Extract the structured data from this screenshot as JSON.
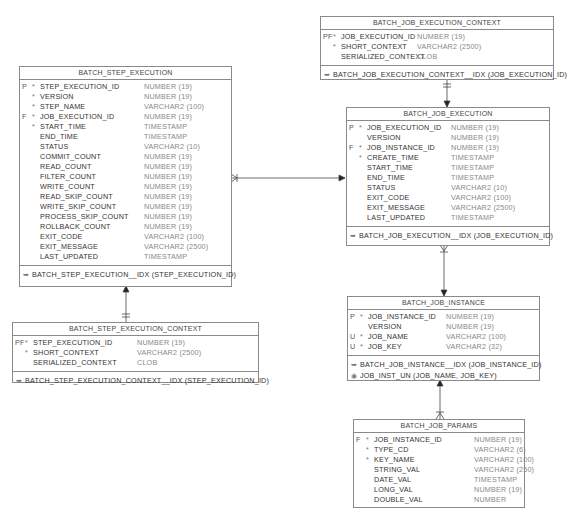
{
  "diagram": {
    "entities": [
      {
        "id": "batch_step_execution",
        "title": "BATCH_STEP_EXECUTION",
        "columns": [
          {
            "key": "P",
            "req": "*",
            "name": "STEP_EXECUTION_ID",
            "type": "NUMBER (19)"
          },
          {
            "key": "",
            "req": "*",
            "name": "VERSION",
            "type": "NUMBER (19)"
          },
          {
            "key": "",
            "req": "*",
            "name": "STEP_NAME",
            "type": "VARCHAR2 (100)"
          },
          {
            "key": "F",
            "req": "*",
            "name": "JOB_EXECUTION_ID",
            "type": "NUMBER (19)"
          },
          {
            "key": "",
            "req": "*",
            "name": "START_TIME",
            "type": "TIMESTAMP"
          },
          {
            "key": "",
            "req": "",
            "name": "END_TIME",
            "type": "TIMESTAMP"
          },
          {
            "key": "",
            "req": "",
            "name": "STATUS",
            "type": "VARCHAR2 (10)"
          },
          {
            "key": "",
            "req": "",
            "name": "COMMIT_COUNT",
            "type": "NUMBER (19)"
          },
          {
            "key": "",
            "req": "",
            "name": "READ_COUNT",
            "type": "NUMBER (19)"
          },
          {
            "key": "",
            "req": "",
            "name": "FILTER_COUNT",
            "type": "NUMBER (19)"
          },
          {
            "key": "",
            "req": "",
            "name": "WRITE_COUNT",
            "type": "NUMBER (19)"
          },
          {
            "key": "",
            "req": "",
            "name": "READ_SKIP_COUNT",
            "type": "NUMBER (19)"
          },
          {
            "key": "",
            "req": "",
            "name": "WRITE_SKIP_COUNT",
            "type": "NUMBER (19)"
          },
          {
            "key": "",
            "req": "",
            "name": "PROCESS_SKIP_COUNT",
            "type": "NUMBER (19)"
          },
          {
            "key": "",
            "req": "",
            "name": "ROLLBACK_COUNT",
            "type": "NUMBER (19)"
          },
          {
            "key": "",
            "req": "",
            "name": "EXIT_CODE",
            "type": "VARCHAR2 (100)"
          },
          {
            "key": "",
            "req": "",
            "name": "EXIT_MESSAGE",
            "type": "VARCHAR2 (2500)"
          },
          {
            "key": "",
            "req": "",
            "name": "LAST_UPDATED",
            "type": "TIMESTAMP"
          }
        ],
        "indexes": [
          {
            "icon": "index-icon",
            "text": "BATCH_STEP_EXECUTION__IDX (STEP_EXECUTION_ID)"
          }
        ]
      },
      {
        "id": "batch_step_execution_context",
        "title": "BATCH_STEP_EXECUTION_CONTEXT",
        "columns": [
          {
            "key": "PF",
            "req": "*",
            "name": "STEP_EXECUTION_ID",
            "type": "NUMBER (19)"
          },
          {
            "key": "",
            "req": "*",
            "name": "SHORT_CONTEXT",
            "type": "VARCHAR2 (2500)"
          },
          {
            "key": "",
            "req": "",
            "name": "SERIALIZED_CONTEXT",
            "type": "CLOB"
          }
        ],
        "indexes": [
          {
            "icon": "index-icon",
            "text": "BATCH_STEP_EXECUTION_CONTEXT__IDX (STEP_EXECUTION_ID)"
          }
        ]
      },
      {
        "id": "batch_job_execution_context",
        "title": "BATCH_JOB_EXECUTION_CONTEXT",
        "columns": [
          {
            "key": "PF",
            "req": "*",
            "name": "JOB_EXECUTION_ID",
            "type": "NUMBER (19)"
          },
          {
            "key": "",
            "req": "*",
            "name": "SHORT_CONTEXT",
            "type": "VARCHAR2 (2500)"
          },
          {
            "key": "",
            "req": "",
            "name": "SERIALIZED_CONTEXT",
            "type": "CLOB"
          }
        ],
        "indexes": [
          {
            "icon": "index-icon",
            "text": "BATCH_JOB_EXECUTION_CONTEXT__IDX (JOB_EXECUTION_ID)"
          }
        ]
      },
      {
        "id": "batch_job_execution",
        "title": "BATCH_JOB_EXECUTION",
        "columns": [
          {
            "key": "P",
            "req": "*",
            "name": "JOB_EXECUTION_ID",
            "type": "NUMBER (19)"
          },
          {
            "key": "",
            "req": "",
            "name": "VERSION",
            "type": "NUMBER (19)"
          },
          {
            "key": "F",
            "req": "*",
            "name": "JOB_INSTANCE_ID",
            "type": "NUMBER (19)"
          },
          {
            "key": "",
            "req": "*",
            "name": "CREATE_TIME",
            "type": "TIMESTAMP"
          },
          {
            "key": "",
            "req": "",
            "name": "START_TIME",
            "type": "TIMESTAMP"
          },
          {
            "key": "",
            "req": "",
            "name": "END_TIME",
            "type": "TIMESTAMP"
          },
          {
            "key": "",
            "req": "",
            "name": "STATUS",
            "type": "VARCHAR2 (10)"
          },
          {
            "key": "",
            "req": "",
            "name": "EXIT_CODE",
            "type": "VARCHAR2 (100)"
          },
          {
            "key": "",
            "req": "",
            "name": "EXIT_MESSAGE",
            "type": "VARCHAR2 (2500)"
          },
          {
            "key": "",
            "req": "",
            "name": "LAST_UPDATED",
            "type": "TIMESTAMP"
          }
        ],
        "indexes": [
          {
            "icon": "index-icon",
            "text": "BATCH_JOB_EXECUTION__IDX (JOB_EXECUTION_ID)"
          }
        ]
      },
      {
        "id": "batch_job_instance",
        "title": "BATCH_JOB_INSTANCE",
        "columns": [
          {
            "key": "P",
            "req": "*",
            "name": "JOB_INSTANCE_ID",
            "type": "NUMBER (19)"
          },
          {
            "key": "",
            "req": "",
            "name": "VERSION",
            "type": "NUMBER (19)"
          },
          {
            "key": "U",
            "req": "*",
            "name": "JOB_NAME",
            "type": "VARCHAR2 (100)"
          },
          {
            "key": "U",
            "req": "*",
            "name": "JOB_KEY",
            "type": "VARCHAR2 (32)"
          }
        ],
        "indexes": [
          {
            "icon": "index-icon",
            "text": "BATCH_JOB_INSTANCE__IDX (JOB_INSTANCE_ID)"
          },
          {
            "icon": "unique-key-icon",
            "text": "JOB_INST_UN (JOB_NAME, JOB_KEY)"
          }
        ]
      },
      {
        "id": "batch_job_params",
        "title": "BATCH_JOB_PARAMS",
        "columns": [
          {
            "key": "F",
            "req": "*",
            "name": "JOB_INSTANCE_ID",
            "type": "NUMBER (19)"
          },
          {
            "key": "",
            "req": "*",
            "name": "TYPE_CD",
            "type": "VARCHAR2 (6)"
          },
          {
            "key": "",
            "req": "*",
            "name": "KEY_NAME",
            "type": "VARCHAR2 (100)"
          },
          {
            "key": "",
            "req": "",
            "name": "STRING_VAL",
            "type": "VARCHAR2 (250)"
          },
          {
            "key": "",
            "req": "",
            "name": "DATE_VAL",
            "type": "TIMESTAMP"
          },
          {
            "key": "",
            "req": "",
            "name": "LONG_VAL",
            "type": "NUMBER (19)"
          },
          {
            "key": "",
            "req": "",
            "name": "DOUBLE_VAL",
            "type": "NUMBER"
          }
        ],
        "indexes": []
      }
    ],
    "relationships": [
      {
        "from": "batch_step_execution",
        "to": "batch_job_execution",
        "type": "many-to-one"
      },
      {
        "from": "batch_step_execution_context",
        "to": "batch_step_execution",
        "type": "one-to-one"
      },
      {
        "from": "batch_job_execution_context",
        "to": "batch_job_execution",
        "type": "one-to-one"
      },
      {
        "from": "batch_job_execution",
        "to": "batch_job_instance",
        "type": "many-to-one"
      },
      {
        "from": "batch_job_params",
        "to": "batch_job_instance",
        "type": "many-to-one"
      }
    ]
  }
}
